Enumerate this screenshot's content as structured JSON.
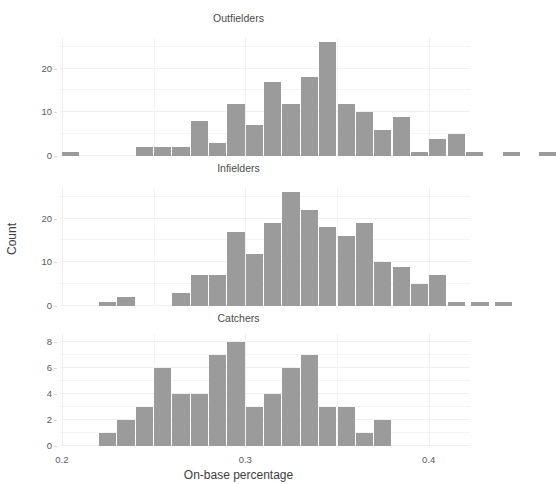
{
  "figure": {
    "corner_artifact": "",
    "xlabel": "On-base percentage",
    "ylabel": "Count",
    "bar_color": "#9b9b9b",
    "background": "#ffffff",
    "grid_color": "#f2f2f2"
  },
  "chart_data": {
    "type": "bar",
    "title": "",
    "xlabel": "On-base percentage",
    "ylabel": "Count",
    "xlim": [
      0.199,
      0.4225
    ],
    "xticks": [
      0.2,
      0.3,
      0.4
    ],
    "xtick_labels": [
      "0.2",
      "0.3",
      "0.4"
    ],
    "bin_width": 0.01,
    "grid": true,
    "legend": "none",
    "panels": [
      {
        "title": "Outfielders",
        "ylim": [
          0,
          27
        ],
        "yticks": [
          0,
          10,
          20
        ],
        "ytick_labels": [
          "0",
          "10",
          "20"
        ],
        "bins": [
          {
            "x": 0.205,
            "count": 1
          },
          {
            "x": 0.245,
            "count": 2
          },
          {
            "x": 0.255,
            "count": 2
          },
          {
            "x": 0.265,
            "count": 2
          },
          {
            "x": 0.275,
            "count": 8
          },
          {
            "x": 0.285,
            "count": 3
          },
          {
            "x": 0.295,
            "count": 12
          },
          {
            "x": 0.305,
            "count": 7
          },
          {
            "x": 0.315,
            "count": 17
          },
          {
            "x": 0.325,
            "count": 12
          },
          {
            "x": 0.335,
            "count": 18
          },
          {
            "x": 0.345,
            "count": 26
          },
          {
            "x": 0.355,
            "count": 12
          },
          {
            "x": 0.365,
            "count": 10
          },
          {
            "x": 0.375,
            "count": 6
          },
          {
            "x": 0.385,
            "count": 9
          },
          {
            "x": 0.395,
            "count": 1
          },
          {
            "x": 0.405,
            "count": 4
          },
          {
            "x": 0.415,
            "count": 5
          },
          {
            "x": 0.425,
            "count": 1
          },
          {
            "x": 0.445,
            "count": 1
          },
          {
            "x": 0.465,
            "count": 1
          }
        ]
      },
      {
        "title": "Infielders",
        "ylim": [
          0,
          27
        ],
        "yticks": [
          0,
          10,
          20
        ],
        "ytick_labels": [
          "0",
          "10",
          "20"
        ],
        "bins": [
          {
            "x": 0.225,
            "count": 1
          },
          {
            "x": 0.235,
            "count": 2
          },
          {
            "x": 0.265,
            "count": 3
          },
          {
            "x": 0.275,
            "count": 7
          },
          {
            "x": 0.285,
            "count": 7
          },
          {
            "x": 0.295,
            "count": 17
          },
          {
            "x": 0.305,
            "count": 12
          },
          {
            "x": 0.315,
            "count": 19
          },
          {
            "x": 0.325,
            "count": 26
          },
          {
            "x": 0.335,
            "count": 22
          },
          {
            "x": 0.345,
            "count": 18
          },
          {
            "x": 0.355,
            "count": 16
          },
          {
            "x": 0.365,
            "count": 19
          },
          {
            "x": 0.375,
            "count": 10
          },
          {
            "x": 0.385,
            "count": 9
          },
          {
            "x": 0.395,
            "count": 5
          },
          {
            "x": 0.405,
            "count": 7
          },
          {
            "x": 0.415,
            "count": 1
          },
          {
            "x": 0.428,
            "count": 1
          },
          {
            "x": 0.441,
            "count": 1
          }
        ]
      },
      {
        "title": "Catchers",
        "ylim": [
          0,
          8.6
        ],
        "yticks": [
          0,
          2,
          4,
          6,
          8
        ],
        "ytick_labels": [
          "0",
          "2",
          "4",
          "6",
          "8"
        ],
        "bins": [
          {
            "x": 0.225,
            "count": 1
          },
          {
            "x": 0.235,
            "count": 2
          },
          {
            "x": 0.245,
            "count": 3
          },
          {
            "x": 0.255,
            "count": 6
          },
          {
            "x": 0.265,
            "count": 4
          },
          {
            "x": 0.275,
            "count": 4
          },
          {
            "x": 0.285,
            "count": 7
          },
          {
            "x": 0.295,
            "count": 8
          },
          {
            "x": 0.305,
            "count": 3
          },
          {
            "x": 0.315,
            "count": 4
          },
          {
            "x": 0.325,
            "count": 6
          },
          {
            "x": 0.335,
            "count": 7
          },
          {
            "x": 0.345,
            "count": 3
          },
          {
            "x": 0.355,
            "count": 3
          },
          {
            "x": 0.365,
            "count": 1
          },
          {
            "x": 0.375,
            "count": 2
          }
        ]
      }
    ]
  }
}
